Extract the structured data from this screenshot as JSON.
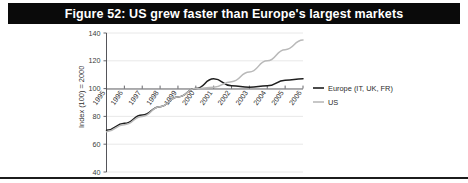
{
  "figure": {
    "banner_title": "Figure 52: US grew faster than Europe's largest markets",
    "banner_bg": "#0a0a0a",
    "banner_fg": "#ffffff"
  },
  "chart_data": {
    "type": "line",
    "title": "Figure 52: US grew faster than Europe's largest markets",
    "xlabel": "",
    "ylabel": "Index (100) = 2000",
    "categories": [
      "1995",
      "1996",
      "1997",
      "1998",
      "1999",
      "2000",
      "2001",
      "2002",
      "2003",
      "2004",
      "2005",
      "2006"
    ],
    "x": [
      1995,
      1996,
      1997,
      1998,
      1999,
      2000,
      2001,
      2002,
      2003,
      2004,
      2005,
      2006
    ],
    "ylim": [
      40,
      140
    ],
    "yticks": [
      40,
      60,
      80,
      100,
      120,
      140
    ],
    "xlim": [
      1995,
      2006
    ],
    "grid": true,
    "legend_position": "right",
    "series": [
      {
        "name": "Europe (IT, UK, FR)",
        "color": "#1f1f1f",
        "values": [
          70,
          75,
          81,
          87,
          94,
          100,
          107,
          102,
          101,
          102,
          106,
          107
        ]
      },
      {
        "name": "US",
        "color": "#b9b9b9",
        "values": [
          69,
          74,
          80,
          87,
          94,
          100,
          101,
          105,
          112,
          120,
          128,
          135
        ]
      }
    ]
  },
  "legend": {
    "items": [
      {
        "label": "Europe (IT, UK, FR)",
        "color": "#1f1f1f"
      },
      {
        "label": "US",
        "color": "#b9b9b9"
      }
    ]
  }
}
